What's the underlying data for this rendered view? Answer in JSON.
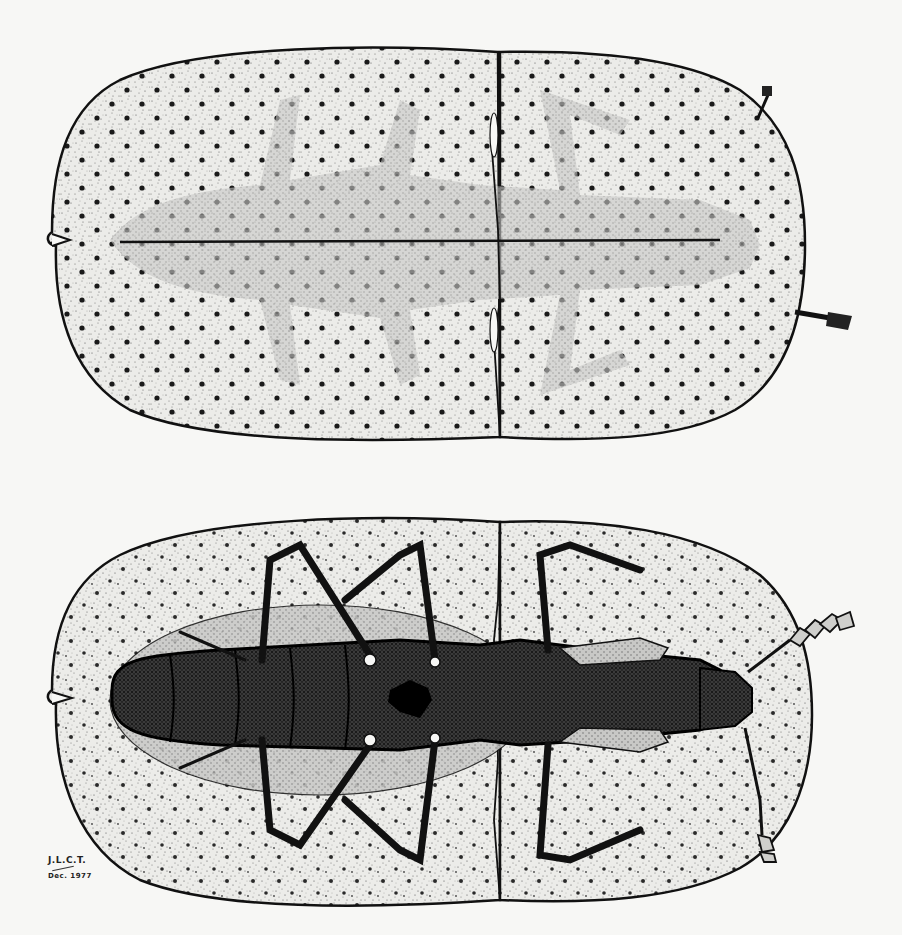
{
  "illustration": {
    "subject": "beetle",
    "views": [
      {
        "id": "dorsal",
        "label": "dorsal view"
      },
      {
        "id": "ventral",
        "label": "ventral view"
      }
    ],
    "style": "pen-and-ink stipple",
    "colors": {
      "paper": "#f7f7f5",
      "ink": "#111111",
      "stipple_fill": "#e4e4e2",
      "dark_body": "#2a2a2a",
      "mid_shade": "#bdbdbb"
    }
  },
  "signature": {
    "initials": "J.L.C.T.",
    "date": "Dec. 1977"
  }
}
